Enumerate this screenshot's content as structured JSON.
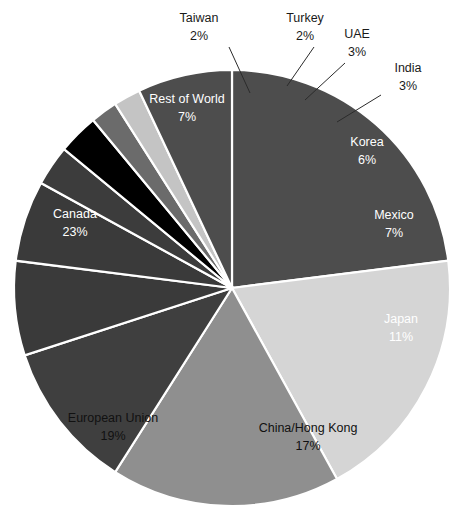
{
  "chart_data": {
    "type": "pie",
    "title": "",
    "subtitle": "",
    "xlabel": "",
    "ylabel": "",
    "legend": "none",
    "grid": false,
    "value_unit": "%",
    "total": 100,
    "categories": [
      "Canada",
      "European Union",
      "China/Hong Kong",
      "Japan",
      "Mexico",
      "Korea",
      "India",
      "UAE",
      "Turkey",
      "Taiwan",
      "Rest of World"
    ],
    "values": [
      23,
      19,
      17,
      11,
      7,
      6,
      3,
      3,
      2,
      2,
      7
    ],
    "slices": [
      {
        "name": "Canada",
        "value": 23,
        "label": "Canada",
        "pct_label": "23%",
        "color": "#4d4d4d",
        "label_placement": "inside",
        "label_x": 75,
        "label_y": 218,
        "pct_x": 75,
        "pct_y": 236
      },
      {
        "name": "European Union",
        "value": 19,
        "label": "European Union",
        "pct_label": "19%",
        "color": "#d5d5d5",
        "label_placement": "inside",
        "label_x": 113,
        "label_y": 422,
        "pct_x": 113,
        "pct_y": 440
      },
      {
        "name": "China/Hong Kong",
        "value": 17,
        "label": "China/Hong Kong",
        "pct_label": "17%",
        "color": "#8f8f8f",
        "label_placement": "inside",
        "label_x": 308,
        "label_y": 432,
        "pct_x": 308,
        "pct_y": 450
      },
      {
        "name": "Japan",
        "value": 11,
        "label": "Japan",
        "pct_label": "11%",
        "color": "#3f3f3f",
        "label_placement": "inside",
        "label_x": 401,
        "label_y": 323,
        "pct_x": 401,
        "pct_y": 341
      },
      {
        "name": "Mexico",
        "value": 7,
        "label": "Mexico",
        "pct_label": "7%",
        "color": "#3a3a3a",
        "label_placement": "inside",
        "label_x": 394,
        "label_y": 219,
        "pct_x": 394,
        "pct_y": 237
      },
      {
        "name": "Korea",
        "value": 6,
        "label": "Korea",
        "pct_label": "6%",
        "color": "#3a3a3a",
        "label_placement": "inside",
        "label_x": 367,
        "label_y": 146,
        "pct_x": 367,
        "pct_y": 164
      },
      {
        "name": "India",
        "value": 3,
        "label": "India",
        "pct_label": "3%",
        "color": "#3c3c3c",
        "label_placement": "outside",
        "label_x": 408,
        "label_y": 72,
        "pct_x": 408,
        "pct_y": 90,
        "leader": "M 378 92 L 330 122"
      },
      {
        "name": "UAE",
        "value": 3,
        "label": "UAE",
        "pct_label": "3%",
        "color": "#000000",
        "label_placement": "outside",
        "label_x": 357,
        "label_y": 38,
        "pct_x": 357,
        "pct_y": 56
      },
      {
        "name": "Turkey",
        "value": 2,
        "label": "Turkey",
        "pct_label": "2%",
        "color": "#6b6b6b",
        "label_placement": "outside",
        "label_x": 305,
        "label_y": 22,
        "pct_x": 305,
        "pct_y": 40
      },
      {
        "name": "Taiwan",
        "value": 2,
        "label": "Taiwan",
        "pct_label": "2%",
        "color": "#c4c4c4",
        "label_placement": "outside",
        "label_x": 199,
        "label_y": 22,
        "pct_x": 199,
        "pct_y": 40
      },
      {
        "name": "Rest of World",
        "value": 7,
        "label": "Rest of World",
        "pct_label": "7%",
        "color": "#4d4d4d",
        "label_placement": "inside",
        "label_x": 187,
        "label_y": 103,
        "pct_x": 187,
        "pct_y": 121
      }
    ],
    "geometry": {
      "center_x": 232,
      "center_y": 288,
      "radius": 218,
      "start_angle_deg": -90,
      "direction": "clockwise"
    }
  }
}
